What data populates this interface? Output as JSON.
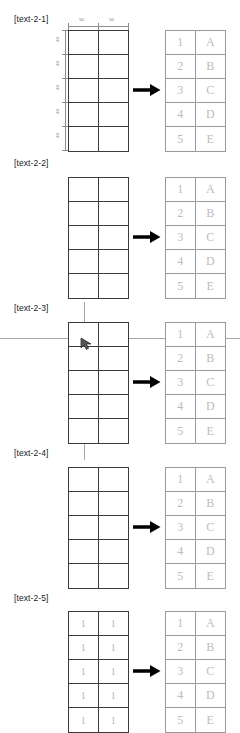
{
  "canvas": {
    "width": 240,
    "height": 733,
    "background": "#ffffff"
  },
  "style": {
    "grid_line": "#3a3a3a",
    "ref_line": "#9a9a9a",
    "ref_text": "#bcbcbc",
    "guide_line": "#a6a6a6",
    "arrow_color": "#000000",
    "dim_color": "#6d6d6d",
    "label_color": "#1a1a1a"
  },
  "reference_table": {
    "columns": 2,
    "rows": [
      {
        "left": "1",
        "right": "A"
      },
      {
        "left": "2",
        "right": "B"
      },
      {
        "left": "3",
        "right": "C"
      },
      {
        "left": "4",
        "right": "D"
      },
      {
        "left": "5",
        "right": "E"
      }
    ]
  },
  "dimensions": {
    "top": {
      "labels": [
        "50",
        "50"
      ]
    },
    "left": {
      "labels": [
        "40",
        "40",
        "40",
        "40",
        "40"
      ]
    }
  },
  "panels": [
    {
      "id": "panel-1",
      "label": "[text-2-1]",
      "top": 14,
      "grid_top": 30,
      "has_dimensions": true,
      "has_diagonal": false,
      "has_crosshair": false,
      "has_cursor": false,
      "diagonal_number": "",
      "filled": false,
      "grid_values": [
        [
          "",
          ""
        ],
        [
          "",
          ""
        ],
        [
          "",
          ""
        ],
        [
          "",
          ""
        ],
        [
          "",
          ""
        ]
      ]
    },
    {
      "id": "panel-2",
      "label": "[text-2-2]",
      "top": 158,
      "grid_top": 177,
      "has_dimensions": false,
      "has_diagonal": true,
      "has_crosshair": false,
      "has_cursor": false,
      "diagonal_number": "",
      "filled": false,
      "grid_values": [
        [
          "",
          ""
        ],
        [
          "",
          ""
        ],
        [
          "",
          ""
        ],
        [
          "",
          ""
        ],
        [
          "",
          ""
        ]
      ]
    },
    {
      "id": "panel-3",
      "label": "[text-2-3]",
      "top": 303,
      "grid_top": 322,
      "has_dimensions": false,
      "has_diagonal": true,
      "has_crosshair": true,
      "has_cursor": true,
      "diagonal_number": "",
      "filled": false,
      "grid_values": [
        [
          "",
          ""
        ],
        [
          "",
          ""
        ],
        [
          "",
          ""
        ],
        [
          "",
          ""
        ],
        [
          "",
          ""
        ]
      ]
    },
    {
      "id": "panel-4",
      "label": "[text-2-4]",
      "top": 448,
      "grid_top": 467,
      "has_dimensions": false,
      "has_diagonal": true,
      "has_crosshair": false,
      "has_cursor": false,
      "diagonal_number": "1",
      "filled": false,
      "grid_values": [
        [
          "",
          ""
        ],
        [
          "",
          ""
        ],
        [
          "",
          ""
        ],
        [
          "",
          ""
        ],
        [
          "",
          ""
        ]
      ]
    },
    {
      "id": "panel-5",
      "label": "[text-2-5]",
      "top": 593,
      "grid_top": 611,
      "has_dimensions": false,
      "has_diagonal": false,
      "has_crosshair": false,
      "has_cursor": false,
      "diagonal_number": "",
      "filled": true,
      "grid_values": [
        [
          "1",
          "1"
        ],
        [
          "1",
          "1"
        ],
        [
          "1",
          "1"
        ],
        [
          "1",
          "1"
        ],
        [
          "1",
          "1"
        ]
      ]
    }
  ]
}
